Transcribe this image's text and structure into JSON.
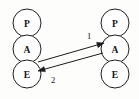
{
  "diagram": {
    "title": "",
    "background_color": "#fdfdfb",
    "stroke_color": "#1a1a1a",
    "node_fill_color": "#ffffff",
    "left_stack": {
      "name": "left-column",
      "nodes": [
        {
          "id": "left-p",
          "label": "P",
          "cx": 27,
          "cy": 23,
          "r": 14
        },
        {
          "id": "left-a",
          "label": "A",
          "cx": 27,
          "cy": 49,
          "r": 14
        },
        {
          "id": "left-e",
          "label": "E",
          "cx": 27,
          "cy": 74,
          "r": 14
        }
      ]
    },
    "right_stack": {
      "name": "right-column",
      "nodes": [
        {
          "id": "right-p",
          "label": "P",
          "cx": 115,
          "cy": 23,
          "r": 14
        },
        {
          "id": "right-a",
          "label": "A",
          "cx": 115,
          "cy": 49,
          "r": 14
        },
        {
          "id": "right-e",
          "label": "E",
          "cx": 115,
          "cy": 74,
          "r": 14
        }
      ]
    },
    "edges": [
      {
        "id": "edge-1",
        "label": "1",
        "from": "left-e",
        "to": "right-a",
        "direction": "left-to-right",
        "x1": 38,
        "y1": 62,
        "x2": 104,
        "y2": 43,
        "label_x": 89,
        "label_y": 36
      },
      {
        "id": "edge-2",
        "label": "2",
        "from": "right-a",
        "to": "left-e",
        "direction": "right-to-left",
        "x1": 103,
        "y1": 53,
        "x2": 38,
        "y2": 71,
        "label_x": 53,
        "label_y": 80
      }
    ]
  }
}
